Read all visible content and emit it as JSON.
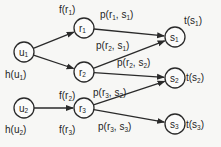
{
  "diagram": {
    "nodes": [
      {
        "id": "u1",
        "base": "u",
        "sub": "1",
        "x": 24,
        "y": 52,
        "label_base": "h(u",
        "label_sub": "1",
        "label_x": 5,
        "label_y": 78
      },
      {
        "id": "u2",
        "base": "u",
        "sub": "2",
        "x": 24,
        "y": 108,
        "label_base": "h(u",
        "label_sub": "2",
        "label_x": 5,
        "label_y": 133
      },
      {
        "id": "r1",
        "base": "r",
        "sub": "1",
        "x": 84,
        "y": 28,
        "label_base": "f(r",
        "label_sub": "1",
        "label_x": 59,
        "label_y": 13
      },
      {
        "id": "r2",
        "base": "r",
        "sub": "2",
        "x": 84,
        "y": 72,
        "label_base": "f(r",
        "label_sub": "2",
        "label_x": 59,
        "label_y": 99
      },
      {
        "id": "r3",
        "base": "r",
        "sub": "3",
        "x": 84,
        "y": 108,
        "label_base": "f(r",
        "label_sub": "3",
        "label_x": 59,
        "label_y": 133
      },
      {
        "id": "s1",
        "base": "s",
        "sub": "1",
        "x": 175,
        "y": 37,
        "label_base": "t(s",
        "label_sub": "1",
        "label_x": 184,
        "label_y": 24
      },
      {
        "id": "s2",
        "base": "s",
        "sub": "2",
        "x": 175,
        "y": 78,
        "label_base": "t(s",
        "label_sub": "2",
        "label_x": 186,
        "label_y": 81
      },
      {
        "id": "s3",
        "base": "s",
        "sub": "3",
        "x": 175,
        "y": 124,
        "label_base": "t(s",
        "label_sub": "3",
        "label_x": 186,
        "label_y": 128
      }
    ],
    "edges": [
      {
        "from": "u1",
        "to": "r1"
      },
      {
        "from": "u1",
        "to": "r2"
      },
      {
        "from": "u2",
        "to": "r3"
      },
      {
        "from": "r1",
        "to": "s1",
        "label": "p(r1, s1)",
        "lx": 100,
        "ly": 18
      },
      {
        "from": "r2",
        "to": "s1",
        "label": "p(r2, s1)",
        "lx": 96,
        "ly": 49
      },
      {
        "from": "r2",
        "to": "s2",
        "label": "p(r2, s2)",
        "lx": 117,
        "ly": 66
      },
      {
        "from": "r3",
        "to": "s2",
        "label": "p(r3, s2)",
        "lx": 93,
        "ly": 96
      },
      {
        "from": "r3",
        "to": "s3",
        "label": "p(r3, s3)",
        "lx": 98,
        "ly": 130
      }
    ],
    "colors": {
      "stroke": "#2a2a2a",
      "background": "#f7f7f5"
    }
  }
}
